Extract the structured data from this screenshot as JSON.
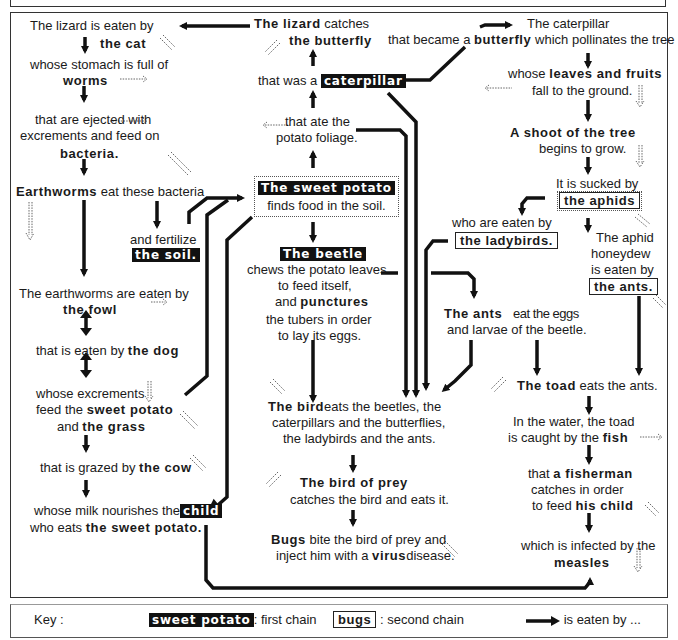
{
  "diagram": {
    "nodes": {
      "lizard_eaten": "The lizard is eaten by",
      "the_cat": "the cat",
      "stomach": "whose stomach is full of",
      "worms": "worms",
      "ejected": "that are ejected with",
      "excrements_feed": "excrements and feed on",
      "bacteria": "bacteria.",
      "earthworms": "Earthworms",
      "eat_bacteria": "eat these bacteria",
      "and_fertilize": "and fertilize",
      "the_soil": "the soil.",
      "earthworms_eaten": "The earthworms are eaten by",
      "the_fowl": "the fowl",
      "eaten_by": "that is eaten by",
      "the_dog": "the dog",
      "whose_excrements": "whose excrements",
      "feed_the": "feed the",
      "sweet_potato": "sweet potato",
      "and": "and",
      "the_grass": "the grass",
      "grazed_by": "that is grazed by",
      "the_cow": "the cow",
      "milk_nourishes": "whose milk nourishes the",
      "child": "child",
      "who_eats": "who eats",
      "the_sweet_potato": "the sweet potato.",
      "lizard_catches_1": "The lizard",
      "lizard_catches_2": "catches",
      "the_butterfly": "the butterfly",
      "that_was_a": "that was a",
      "caterpillar": "caterpillar",
      "ate_the": "that ate the",
      "potato_foliage": "potato foliage.",
      "sweet_potato_title": "The sweet potato",
      "finds_food": "finds food in the soil.",
      "the_beetle": "The beetle",
      "chews": "chews the potato leaves",
      "to_feed": "to feed itself,",
      "and_punctures_1": "and",
      "punctures": "punctures",
      "tubers": "the tubers in order",
      "lay_eggs": "to lay its eggs.",
      "the_bird": "The bird",
      "bird_eats_1": "eats the beetles, the",
      "bird_eats_2": "caterpillars and the butterflies,",
      "bird_eats_3": "the ladybirds and the ants.",
      "bird_of_prey": "The bird of prey",
      "catches_bird": "catches the bird and eats it.",
      "bugs": "Bugs",
      "bite": "bite the bird of prey and",
      "inject": "inject him with a",
      "virus": "virus",
      "disease": "disease.",
      "caterpillar_became_1": "The caterpillar",
      "that_became": "that became a",
      "butterfly": "butterfly",
      "pollinates": "which pollinates the tree",
      "whose": "whose",
      "leaves_fruits": "leaves and fruits",
      "fall_ground": "fall to the ground.",
      "a_shoot": "A shoot of the tree",
      "begins_grow": "begins to grow.",
      "sucked_by": "It is sucked by",
      "the_aphids": "the aphids",
      "who_eaten": "who are eaten by",
      "the_ladybirds": "the ladybirds.",
      "aphid_1": "The aphid",
      "aphid_2": "honeydew",
      "aphid_3": "is eaten by",
      "the_ants_box": "the ants.",
      "the_ants": "The ants",
      "eat_eggs": "eat the eggs",
      "larvae": "and larvae of the beetle.",
      "the_toad": "The toad",
      "eats_ants": "eats the ants.",
      "in_water": "In the water, the toad",
      "caught_by": "is caught by the",
      "fish": "fish",
      "that_a": "that",
      "fisherman": "a fisherman",
      "catches_order": "catches in order",
      "to_feed2": "to feed",
      "his_child": "his child",
      "infected": "which is infected by the",
      "measles": "measles"
    }
  },
  "key": {
    "label": "Key :",
    "first_sample": "sweet potato",
    "first_desc": ": first chain",
    "second_sample": "bugs",
    "second_desc": ": second chain",
    "arrow_desc": "is eaten by ..."
  },
  "colors": {
    "ink": "#111111",
    "background": "#ffffff",
    "frame": "#333333"
  }
}
